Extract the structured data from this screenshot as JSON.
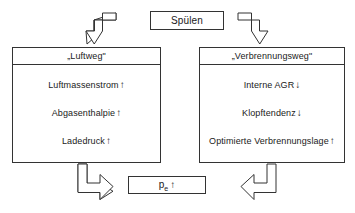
{
  "diagram": {
    "source_node": {
      "label": "Spülen"
    },
    "pathways": [
      {
        "id": "luftweg",
        "header": "„Luftweg\"",
        "items": [
          {
            "text": "Luftmassenstrom",
            "trend": "↑"
          },
          {
            "text": "Abgasenthalpie",
            "trend": "↑"
          },
          {
            "text": "Ladedruck",
            "trend": "↑"
          }
        ]
      },
      {
        "id": "verbrennungsweg",
        "header": "„Verbrennungsweg\"",
        "items": [
          {
            "text": "Interne AGR",
            "trend": "↓"
          },
          {
            "text": "Klopftendenz",
            "trend": "↓"
          },
          {
            "text": "Optimierte Verbrennungslage",
            "trend": "↑"
          }
        ]
      }
    ],
    "result_node": {
      "symbol": "p",
      "subscript": "e",
      "trend": "↑"
    },
    "caption_fragment": "",
    "colors": {
      "stroke": "#333333",
      "background": "#ffffff",
      "text": "#1a1a1a"
    }
  }
}
